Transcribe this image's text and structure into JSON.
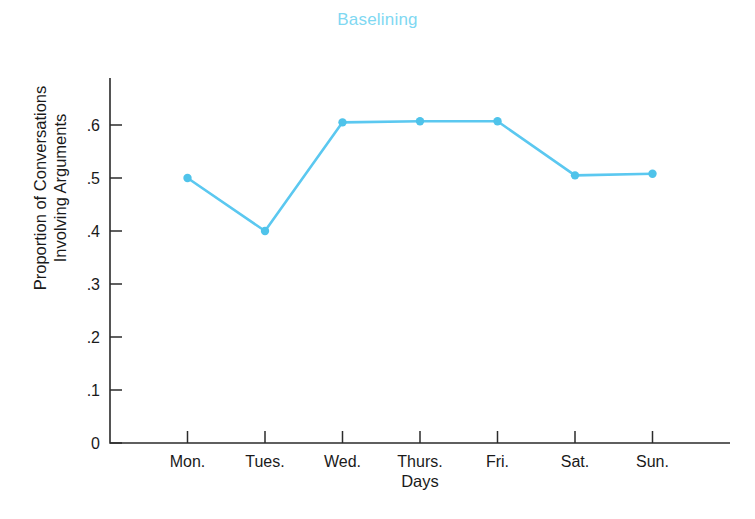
{
  "chart_data": {
    "type": "line",
    "title": "Baselining",
    "xlabel": "Days",
    "ylabel": "Proportion of Conversations\nInvolving Arguments",
    "categories": [
      "Mon.",
      "Tues.",
      "Wed.",
      "Thurs.",
      "Fri.",
      "Sat.",
      "Sun."
    ],
    "values": [
      0.5,
      0.4,
      0.605,
      0.607,
      0.607,
      0.505,
      0.508
    ],
    "series": [
      {
        "name": "Proportion of Conversations Involving Arguments",
        "values": [
          0.5,
          0.4,
          0.605,
          0.607,
          0.607,
          0.505,
          0.508
        ]
      }
    ],
    "ylim": [
      0,
      0.66
    ],
    "xlim": [
      0,
      8
    ],
    "ytick_labels": [
      "0",
      ".1",
      ".2",
      ".3",
      ".4",
      ".5",
      ".6"
    ],
    "ytick_values": [
      0,
      0.1,
      0.2,
      0.3,
      0.4,
      0.5,
      0.6
    ],
    "xtick_labels": [
      "Mon.",
      "Tues.",
      "Wed.",
      "Thurs.",
      "Fri.",
      "Sat.",
      "Sun."
    ],
    "grid": false,
    "legend": false,
    "legend_position": "none",
    "marker": "circle",
    "colors": {
      "line": "#5bc8f0",
      "marker": "#4fc3ea",
      "title": "#7fd8f2",
      "axis": "#2b2b2b",
      "text": "#1a1a1a",
      "background": "#ffffff"
    }
  },
  "labels": {
    "title": "Baselining",
    "ylabel": "Proportion of Conversations\nInvolving Arguments",
    "xlabel": "Days"
  }
}
